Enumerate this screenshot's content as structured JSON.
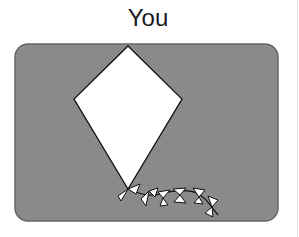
{
  "title": "You",
  "colors": {
    "panel": "#8a8a8a",
    "panel_border": "#666666",
    "kite_fill": "#ffffff",
    "outline": "#111111"
  },
  "icons": {
    "kite": "kite-icon",
    "tail": "kite-tail-bows"
  }
}
